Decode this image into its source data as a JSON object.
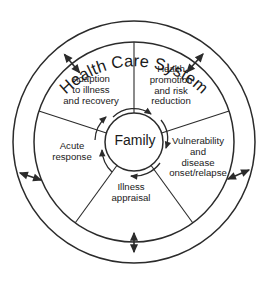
{
  "diagram": {
    "title": "Health Care System",
    "center": {
      "label": "Family"
    },
    "segments": [
      {
        "id": "health-promotion",
        "label": "Health\npromotion\nand risk\nreduction",
        "position": "top-right"
      },
      {
        "id": "vulnerability",
        "label": "Vulnerability\nand\ndisease\nonset/relapse",
        "position": "right"
      },
      {
        "id": "illness-appraisal",
        "label": "Illness\nappraisal",
        "position": "bottom"
      },
      {
        "id": "acute-response",
        "label": "Acute\nresponse",
        "position": "left"
      },
      {
        "id": "adaption",
        "label": "Adaption\nto illness\nand recovery",
        "position": "top-left"
      }
    ],
    "colors": {
      "stroke": "#2b2b2b",
      "text": "#1a1a1a",
      "background": "#ffffff"
    },
    "geometry": {
      "center_x": 134,
      "center_y": 142,
      "outer_radius": 121,
      "inner_radius": 100,
      "hub_radius": 29
    }
  }
}
